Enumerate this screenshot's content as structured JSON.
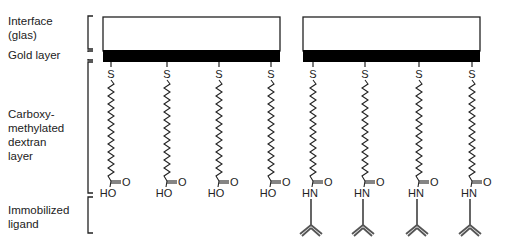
{
  "labels": {
    "interface": [
      "Interface",
      "(glas)"
    ],
    "gold": "Gold layer",
    "dextran": [
      "Carboxy-",
      "methylated",
      "dextran",
      "layer"
    ],
    "ligand": [
      "Immobilized",
      "ligand"
    ]
  },
  "atoms": {
    "sulfur": "S",
    "hydroxyl": "HO",
    "amide_nh": "HN",
    "oxygen": "O"
  },
  "panels": [
    {
      "name": "before-immobilization",
      "chain_x": [
        111,
        167,
        219,
        271
      ],
      "terminal": "HO",
      "ligand": false
    },
    {
      "name": "after-immobilization",
      "chain_x": [
        313,
        365,
        419,
        472
      ],
      "terminal": "HN",
      "ligand": true
    }
  ],
  "colors": {
    "gold_layer": "#000000",
    "interface_fill": "#ffffff",
    "line": "#222222",
    "ligand": "#555555"
  }
}
